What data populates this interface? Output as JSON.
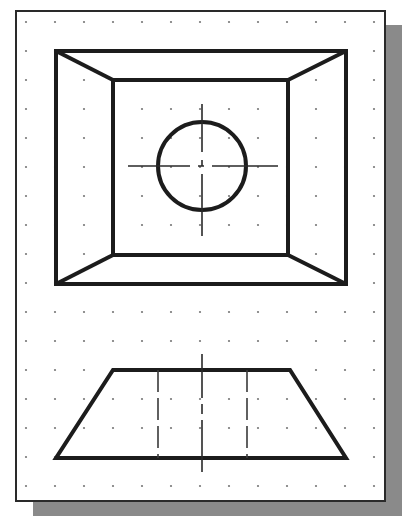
{
  "figure": {
    "type": "orthographic-projection",
    "colors": {
      "line": "#1c1c1c",
      "grid_dot": "#777777",
      "sheet": "#ffffff",
      "shadow": "#8a8a8a"
    },
    "grid": {
      "origin_x": 26,
      "origin_y": 22,
      "spacing": 29,
      "cols": 13,
      "rows": 17
    },
    "top_view": {
      "outer_rect": {
        "x1": 56,
        "y1": 51,
        "x2": 346,
        "y2": 284
      },
      "inner_rect": {
        "x1": 113,
        "y1": 80,
        "x2": 288,
        "y2": 255
      },
      "hole": {
        "cx": 202,
        "cy": 166,
        "r": 44
      },
      "center_mark": {
        "h_x1": 128,
        "h_x2": 278,
        "v_y1": 104,
        "v_y2": 236
      }
    },
    "front_view": {
      "trapezoid": {
        "top_x1": 113,
        "top_x2": 290,
        "top_y": 370,
        "bot_x1": 56,
        "bot_x2": 346,
        "bot_y": 458
      },
      "hidden_lines_x": [
        158,
        247
      ],
      "center_line": {
        "x": 202,
        "y1": 354,
        "y2": 472
      }
    }
  }
}
